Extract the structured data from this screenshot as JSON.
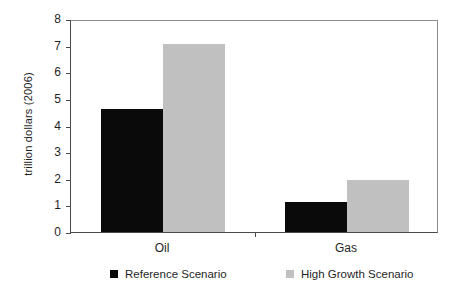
{
  "chart_data": {
    "type": "bar",
    "title": "",
    "subtitle": "",
    "xlabel": "",
    "ylabel": "trillion dollars (2006)",
    "categories": [
      "Oil",
      "Gas"
    ],
    "series": [
      {
        "name": "Reference Scenario",
        "color": "#0a0a0a",
        "values": [
          4.62,
          1.13
        ]
      },
      {
        "name": "High Growth Scenario",
        "color": "#c0c0c0",
        "values": [
          7.08,
          1.95
        ]
      }
    ],
    "ylim": [
      0,
      8
    ],
    "yticks": [
      0,
      1,
      2,
      3,
      4,
      5,
      6,
      7,
      8
    ],
    "ytick_labels": [
      "0",
      "1",
      "2",
      "3",
      "4",
      "5",
      "6",
      "7",
      "8"
    ],
    "grid": false,
    "legend_position": "bottom",
    "axis_color": "#4a4a4a",
    "frame_color": "#8d8d8d",
    "background": "#ffffff"
  }
}
